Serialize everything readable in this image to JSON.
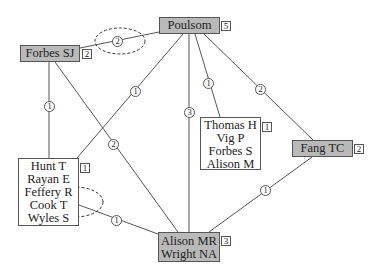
{
  "diagram": {
    "type": "network",
    "nodes": [
      {
        "id": "forbes_sj",
        "lines": [
          "Forbes SJ"
        ],
        "count": "2",
        "shaded": true
      },
      {
        "id": "poulsom",
        "lines": [
          "Poulsom"
        ],
        "count": "5",
        "shaded": true
      },
      {
        "id": "thomas_group",
        "lines": [
          "Thomas H",
          "Vig P",
          "Forbes S",
          "Alison M"
        ],
        "count": "1",
        "shaded": false
      },
      {
        "id": "fang_tc",
        "lines": [
          "Fang TC"
        ],
        "count": "2",
        "shaded": true
      },
      {
        "id": "hunt_group",
        "lines": [
          "Hunt T",
          "Rayan E",
          "Feffery R",
          "Cook T",
          "Wyles S"
        ],
        "count": "1",
        "shaded": false
      },
      {
        "id": "alison_wright",
        "lines": [
          "Alison MR",
          "Wright NA"
        ],
        "count": "3",
        "shaded": true
      }
    ],
    "edges": [
      {
        "from": "forbes_sj",
        "to": "poulsom",
        "weight": "2",
        "highlighted": true
      },
      {
        "from": "forbes_sj",
        "to": "hunt_group",
        "weight": "1"
      },
      {
        "from": "forbes_sj",
        "to": "alison_wright",
        "weight": "2"
      },
      {
        "from": "poulsom",
        "to": "hunt_group",
        "weight": "1"
      },
      {
        "from": "poulsom",
        "to": "alison_wright",
        "weight": "3"
      },
      {
        "from": "poulsom",
        "to": "thomas_group",
        "weight": "1"
      },
      {
        "from": "poulsom",
        "to": "fang_tc",
        "weight": "2"
      },
      {
        "from": "fang_tc",
        "to": "alison_wright",
        "weight": "1"
      },
      {
        "from": "hunt_group",
        "to": "alison_wright",
        "weight": "1",
        "highlighted": true
      }
    ],
    "colors": {
      "shaded_fill": "#b9b9b9",
      "line": "#555555",
      "background": "#ffffff"
    }
  }
}
